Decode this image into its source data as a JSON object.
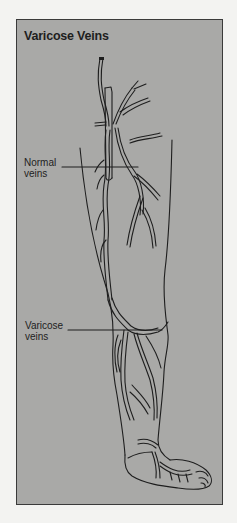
{
  "figure": {
    "title": "Varicose Veins",
    "labels": {
      "normal_veins": "Normal\nveins",
      "varicose_veins": "Varicose\nveins"
    },
    "colors": {
      "page_background": "#f3f3f1",
      "panel_fill": "#a9a9a7",
      "ink": "#1e1e1e"
    },
    "illustration": "leg-with-veins-line-drawing"
  }
}
